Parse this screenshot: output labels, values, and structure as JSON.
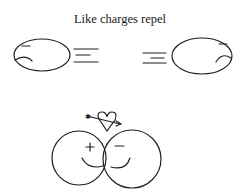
{
  "title": "Like charges repel",
  "top_pair": {
    "left_particle": {
      "charge": "-",
      "motion": "moving left"
    },
    "right_particle": {
      "charge": "-",
      "motion": "moving right"
    }
  },
  "bottom_pair": {
    "left_particle": {
      "charge": "+",
      "expression": "smile"
    },
    "right_particle": {
      "charge": "-",
      "expression": "smile"
    },
    "symbol": "heart-with-arrow"
  },
  "colors": {
    "line": "#1e1e1e",
    "background": "#ffffff"
  }
}
